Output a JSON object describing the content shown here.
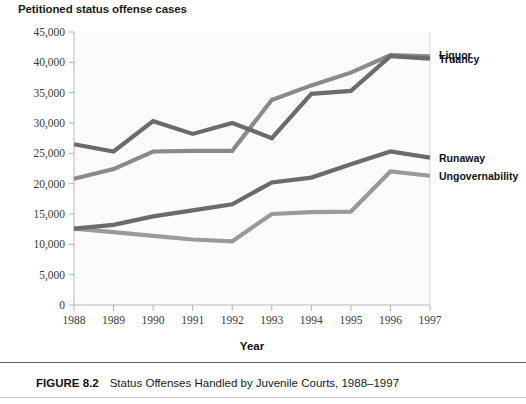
{
  "figure": {
    "caption_label": "FIGURE 8.2",
    "caption_text": "Status Offenses Handled by Juvenile Courts, 1988–1997"
  },
  "chart_data": {
    "type": "line",
    "title": "Petitioned status offense cases",
    "xlabel": "Year",
    "ylabel": "",
    "categories": [
      "1988",
      "1989",
      "1990",
      "1991",
      "1992",
      "1993",
      "1994",
      "1995",
      "1996",
      "1997"
    ],
    "x": [
      1988,
      1989,
      1990,
      1991,
      1992,
      1993,
      1994,
      1995,
      1996,
      1997
    ],
    "ylim": [
      0,
      45000
    ],
    "ytick_labels": [
      "0",
      "5,000",
      "10,000",
      "15,000",
      "20,000",
      "25,000",
      "30,000",
      "35,000",
      "40,000",
      "45,000"
    ],
    "ytick_values": [
      0,
      5000,
      10000,
      15000,
      20000,
      25000,
      30000,
      35000,
      40000,
      45000
    ],
    "grid": false,
    "legend_position": "right-of-plot",
    "series": [
      {
        "name": "Truancy",
        "color": "#6b6b6b",
        "label_x": 1997,
        "label_y": 40600,
        "values": [
          26500,
          25300,
          30300,
          28200,
          30000,
          27500,
          34800,
          35300,
          41000,
          40600
        ]
      },
      {
        "name": "Liquor",
        "color": "#8a8a8a",
        "label_x": 1997,
        "label_y": 41200,
        "values": [
          20800,
          22400,
          25300,
          25400,
          25400,
          33800,
          36200,
          38300,
          41200,
          41000
        ]
      },
      {
        "name": "Runaway",
        "color": "#6b6b6b",
        "label_x": 1997,
        "label_y": 24300,
        "values": [
          12600,
          13200,
          14600,
          15600,
          16600,
          20200,
          21000,
          23200,
          25300,
          24300
        ]
      },
      {
        "name": "Ungovernability",
        "color": "#9a9a9a",
        "label_x": 1997,
        "label_y": 21300,
        "values": [
          12600,
          12000,
          11400,
          10800,
          10500,
          15000,
          15300,
          15400,
          22000,
          21300
        ]
      }
    ]
  },
  "axis": {
    "x_title": "Year"
  }
}
